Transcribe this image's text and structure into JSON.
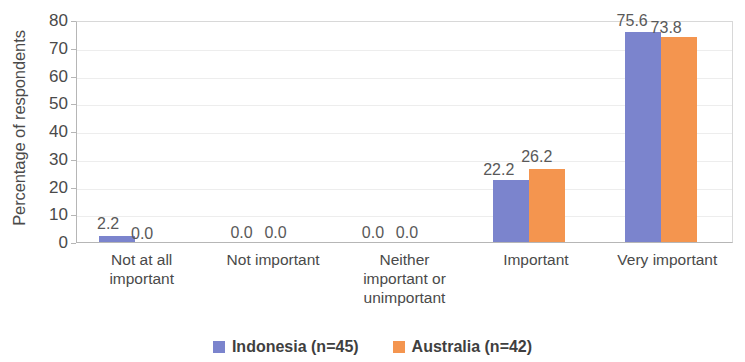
{
  "chart_data": {
    "type": "bar",
    "title": "",
    "subtitle": "",
    "xlabel": "",
    "ylabel": "Percentage of respondents",
    "ylim": [
      0,
      80
    ],
    "ytick_step": 10,
    "yticks": [
      "80",
      "70",
      "60",
      "50",
      "40",
      "30",
      "20",
      "10",
      "0"
    ],
    "grid": true,
    "legend_position": "bottom",
    "categories": [
      "Not at all important",
      "Not important",
      "Neither important or unimportant",
      "Important",
      "Very important"
    ],
    "category_lines": [
      [
        "Not at all",
        "important"
      ],
      [
        "Not important"
      ],
      [
        "Neither",
        "important or",
        "unimportant"
      ],
      [
        "Important"
      ],
      [
        "Very important"
      ]
    ],
    "series": [
      {
        "name": "Indonesia (n=45)",
        "color": "#7b84cd",
        "values": [
          2.2,
          0.0,
          0.0,
          22.2,
          75.6
        ],
        "labels": [
          "2.2",
          "0.0",
          "0.0",
          "22.2",
          "75.6"
        ]
      },
      {
        "name": "Australia (n=42)",
        "color": "#f4954f",
        "values": [
          0.0,
          0.0,
          0.0,
          26.2,
          73.8
        ],
        "labels": [
          "0.0",
          "0.0",
          "0.0",
          "26.2",
          "73.8"
        ]
      }
    ]
  },
  "legend": {
    "items": [
      {
        "label": "Indonesia (n=45)",
        "color": "#7b84cd"
      },
      {
        "label": "Australia (n=42)",
        "color": "#f4954f"
      }
    ]
  },
  "colors": {
    "series_indonesia": "#7b84cd",
    "series_australia": "#f4954f",
    "gridline": "#ededed",
    "axis": "#b6b6b6",
    "text": "#4a4a4a",
    "background": "#ffffff"
  }
}
